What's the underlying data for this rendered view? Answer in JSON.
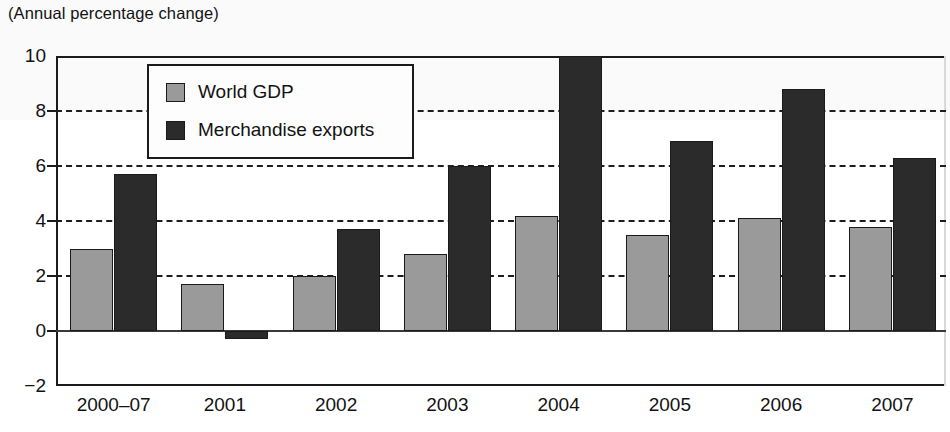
{
  "figure": {
    "caption": "(Annual percentage change)"
  },
  "chart_data": {
    "type": "bar",
    "title": "",
    "subtitle": "(Annual percentage change)",
    "xlabel": "",
    "ylabel": "",
    "ylim": [
      -2,
      10
    ],
    "yticks": [
      -2,
      0,
      2,
      4,
      6,
      8,
      10
    ],
    "ytick_labels": [
      "−2",
      "0",
      "2",
      "4",
      "6",
      "8",
      "10"
    ],
    "gridlines_at": [
      2,
      4,
      6,
      8
    ],
    "grid": true,
    "grid_style": "dashed",
    "legend_position": "upper-left-inside",
    "categories": [
      "2000–07",
      "2001",
      "2002",
      "2003",
      "2004",
      "2005",
      "2006",
      "2007"
    ],
    "series": [
      {
        "name": "World GDP",
        "color": "#9a9a9a",
        "values": [
          3.0,
          1.7,
          2.0,
          2.8,
          4.2,
          3.5,
          4.1,
          3.8
        ]
      },
      {
        "name": "Merchandise exports",
        "color": "#2b2b2b",
        "values": [
          5.7,
          -0.3,
          3.7,
          6.0,
          10.0,
          6.9,
          8.8,
          6.3
        ]
      }
    ]
  },
  "legend": {
    "items": [
      {
        "label": "World GDP",
        "swatch": "gdp"
      },
      {
        "label": "Merchandise exports",
        "swatch": "exp"
      }
    ]
  }
}
